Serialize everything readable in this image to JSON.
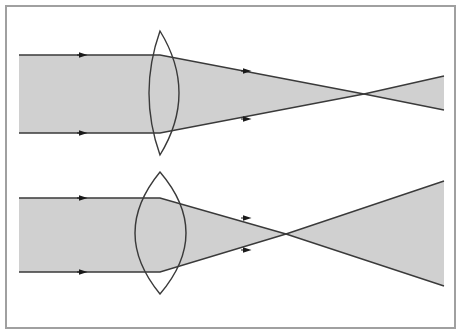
{
  "figure": {
    "width": 461,
    "height": 334
  },
  "style": {
    "background_color": "#ffffff",
    "border_color": "#a0a0a0",
    "border_width": 2,
    "beam_fill_color": "#d0d0d0",
    "beam_fill_opacity": 1,
    "ray_line_color": "#3a3a3a",
    "ray_line_width": 1.4,
    "lens_outline_color": "#3a3a3a",
    "lens_outline_width": 1.4,
    "lens_fill_color": "none",
    "arrow_color": "#1a1a1a"
  },
  "frame": {
    "x": 6,
    "y": 6,
    "width": 449,
    "height": 322
  },
  "diagrams": [
    {
      "id": "top-diagram",
      "label": "Long focal length lens",
      "beam": {
        "entry_left_x": 19,
        "top_edge_y": 55,
        "bottom_edge_y": 133,
        "half_height": 39,
        "axis_y": 94
      },
      "lens": {
        "center_x": 160,
        "top_apex_y": 31,
        "bottom_apex_y": 155,
        "left_bulge_x": 149,
        "right_bulge_x": 179,
        "thickness": 30,
        "aperture": 124,
        "type": "biconvex"
      },
      "focus": {
        "x": 364,
        "y": 94
      },
      "exit": {
        "right_x": 444,
        "top_y": 76,
        "bottom_y": 110
      },
      "arrows": [
        {
          "x": 83,
          "y": 55,
          "direction": "right",
          "on": "incoming-top-ray"
        },
        {
          "x": 83,
          "y": 133,
          "direction": "right",
          "on": "incoming-bottom-ray"
        },
        {
          "x": 247,
          "y": 71,
          "direction": "right",
          "on": "converging-top-ray"
        },
        {
          "x": 247,
          "y": 119,
          "direction": "right",
          "on": "converging-bottom-ray"
        }
      ]
    },
    {
      "id": "bottom-diagram",
      "label": "Short focal length lens",
      "beam": {
        "entry_left_x": 19,
        "top_edge_y": 198,
        "bottom_edge_y": 272,
        "half_height": 37,
        "axis_y": 235
      },
      "lens": {
        "center_x": 160,
        "top_apex_y": 172,
        "bottom_apex_y": 294,
        "left_bulge_x": 135,
        "right_bulge_x": 186,
        "thickness": 51,
        "aperture": 122,
        "type": "biconvex"
      },
      "focus": {
        "x": 286,
        "y": 234
      },
      "exit": {
        "right_x": 444,
        "top_y": 181,
        "bottom_y": 286
      },
      "arrows": [
        {
          "x": 83,
          "y": 198,
          "direction": "right",
          "on": "incoming-top-ray"
        },
        {
          "x": 83,
          "y": 272,
          "direction": "right",
          "on": "incoming-bottom-ray"
        },
        {
          "x": 247,
          "y": 218,
          "direction": "right",
          "on": "converging-top-ray"
        },
        {
          "x": 247,
          "y": 250,
          "direction": "right",
          "on": "converging-bottom-ray"
        }
      ]
    }
  ],
  "chart_data": {
    "type": "diagram",
    "subtitle": "",
    "xlabel": "",
    "ylabel": "",
    "series": [
      {
        "name": "Top diagram - long focal length",
        "incoming_beam_half_height": 39,
        "lens_center_x": 160,
        "focal_point_x": 364,
        "focal_length_px": 204,
        "lens_thickness_px": 30,
        "beam_half_height_at_right_edge": 17
      },
      {
        "name": "Bottom diagram - short focal length",
        "incoming_beam_half_height": 37,
        "lens_center_x": 160,
        "focal_point_x": 286,
        "focal_length_px": 126,
        "lens_thickness_px": 51,
        "beam_half_height_at_right_edge": 52
      }
    ],
    "legend_position": "none",
    "grid": false
  }
}
